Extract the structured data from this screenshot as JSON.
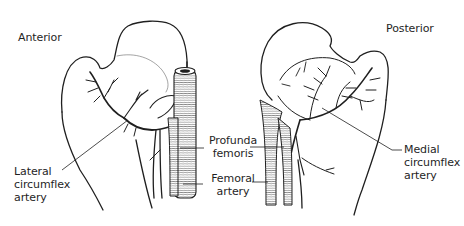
{
  "diagram": {
    "views": {
      "anterior": {
        "title": "Anterior"
      },
      "posterior": {
        "title": "Posterior"
      }
    },
    "labels": {
      "lateral_circumflex": "Lateral\ncircumflex\nartery",
      "profunda_femoris": "Profunda\nfemoris",
      "femoral_artery": "Femoral\nartery",
      "medial_circumflex": "Medial\ncircumflex\nartery"
    },
    "colors": {
      "line": "#1f1f1f",
      "background": "#ffffff"
    }
  }
}
